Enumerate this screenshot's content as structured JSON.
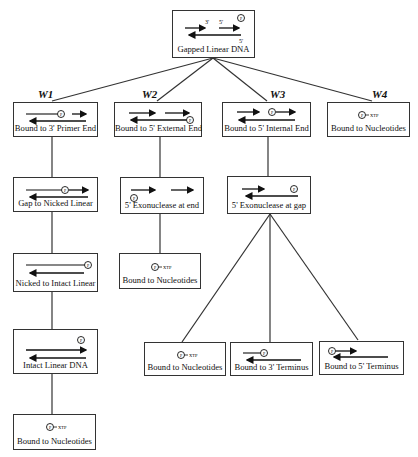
{
  "diagram": {
    "root": {
      "label": "Gapped Linear DNA",
      "end_labels": [
        "3'",
        "5'",
        "5'"
      ]
    },
    "pathways": [
      {
        "id": "W1",
        "label": "W1"
      },
      {
        "id": "W2",
        "label": "W2"
      },
      {
        "id": "W3",
        "label": "W3"
      },
      {
        "id": "W4",
        "label": "W4"
      }
    ],
    "nodes": {
      "w1_1": {
        "label": "Bound to 3' Primer End"
      },
      "w1_2": {
        "label": "Gap to Nicked Linear"
      },
      "w1_3": {
        "label": "Nicked to Intact Linear"
      },
      "w1_4": {
        "label": "Intact Linear DNA"
      },
      "w1_5": {
        "label": "Bound to Nucleotides",
        "tag": "XTP"
      },
      "w2_1": {
        "label": "Bound to 5' External End"
      },
      "w2_2": {
        "label": "5' Exonuclease at end"
      },
      "w2_3": {
        "label": "Bound to Nucleotides",
        "tag": "XTP"
      },
      "w3_1": {
        "label": "Bound to 5' Internal End"
      },
      "w3_2": {
        "label": "5' Exonuclease at gap"
      },
      "w3_3a": {
        "label": "Bound to Nucleotides",
        "tag": "XTP"
      },
      "w3_3b": {
        "label": "Bound to 3' Terminus"
      },
      "w3_3c": {
        "label": "Bound to 5' Terminus"
      },
      "w4_1": {
        "label": "Bound to Nucleotides",
        "tag": "XTP"
      }
    },
    "polymerase_symbol": "P"
  }
}
